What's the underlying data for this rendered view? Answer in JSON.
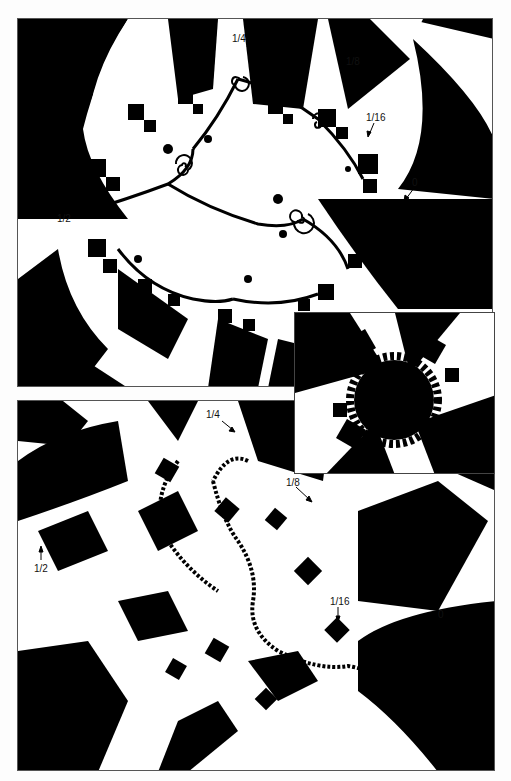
{
  "figure": {
    "panels": [
      {
        "id": "top",
        "description": "Julia set with checkerboard binary decomposition (dendritic/spiral)",
        "labels": [
          {
            "text": "1/4",
            "x": 232,
            "y": 40
          },
          {
            "text": "1/8",
            "x": 346,
            "y": 58
          },
          {
            "text": "1/16",
            "x": 369,
            "y": 117
          },
          {
            "text": "0",
            "x": 412,
            "y": 178
          },
          {
            "text": "1/2",
            "x": 57,
            "y": 211
          }
        ]
      },
      {
        "id": "inset",
        "description": "Circle (unit disk) with checkerboard binary decomposition"
      },
      {
        "id": "bottom",
        "description": "Julia set with checkerboard binary decomposition (elongated)",
        "labels": [
          {
            "text": "1/4",
            "x": 206,
            "y": 410
          },
          {
            "text": "1/8",
            "x": 285,
            "y": 477
          },
          {
            "text": "1/2",
            "x": 35,
            "y": 566
          },
          {
            "text": "1/16",
            "x": 330,
            "y": 600
          },
          {
            "text": "0",
            "x": 437,
            "y": 609
          }
        ]
      }
    ],
    "colors": {
      "fill": "#000000",
      "background": "#ffffff",
      "border": "#555555"
    }
  }
}
